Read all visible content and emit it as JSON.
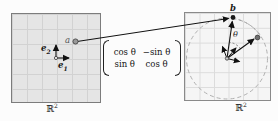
{
  "left_plane": {
    "label": {
      "base": "ℝ",
      "sup": "2"
    },
    "basis_e2": {
      "base": "e",
      "sub": "2"
    },
    "basis_e1": {
      "base": "e",
      "sub": "1"
    },
    "point_label": "a"
  },
  "rotation_matrix": {
    "r0c0": "cos θ",
    "r0c1": "−sin θ",
    "r1c0": "sin θ",
    "r1c1": "cos θ"
  },
  "right_plane": {
    "label": {
      "base": "ℝ",
      "sup": "2"
    },
    "point_label": "b",
    "angle_label": "θ"
  },
  "colors": {
    "left_grid_bg": "#e5e5e5",
    "right_grid_bg": "#f5f5f5",
    "grid_line": "#d2d2d2",
    "stroke": "#111111",
    "dashed_circle": "#b0b0b0",
    "point_a_fill": "#9a9a9a",
    "point_b_fill": "#1a1a1a"
  }
}
